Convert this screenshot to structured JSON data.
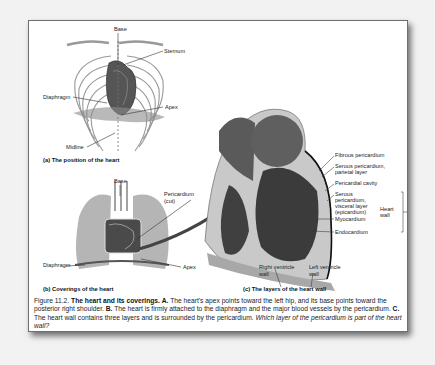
{
  "panel_a": {
    "caption": "(a) The position of the heart",
    "labels": {
      "base": "Base",
      "sternum": "Sternum",
      "diaphragm": "Diaphragm",
      "apex": "Apex",
      "midline": "Midline"
    }
  },
  "panel_b": {
    "caption": "(b) Coverings of the heart",
    "labels": {
      "base": "Base",
      "pericardium_line1": "Pericardium",
      "pericardium_line2": "(cut)",
      "diaphragm": "Diaphragm",
      "apex": "Apex"
    }
  },
  "panel_c": {
    "caption": "(c) The layers of the heart wall",
    "labels": {
      "fibrous": "Fibrous pericardium",
      "serous_parietal_1": "Serous pericardium,",
      "serous_parietal_2": "parietal layer",
      "pericardial_cavity": "Pericardial cavity",
      "serous_visceral_1": "Serous",
      "serous_visceral_2": "pericardium,",
      "serous_visceral_3": "visceral layer",
      "serous_visceral_4": "(epicardium)",
      "myocardium": "Myocardium",
      "endocardium": "Endocardium",
      "heart_wall_1": "Heart",
      "heart_wall_2": "wall",
      "right_ventricle_1": "Right ventricle",
      "right_ventricle_2": "wall",
      "left_ventricle_1": "Left ventricle",
      "left_ventricle_2": "wall"
    }
  },
  "figure_caption": {
    "number": "Figure 11.2.",
    "title": "The heart and its coverings.",
    "a_label": "A.",
    "a_text": "The heart's apex points toward the left hip, and its base points toward the posterior right shoulder.",
    "b_label": "B.",
    "b_text": "The heart is firmly attached to the diaphragm and the major blood vessels by the pericardium.",
    "c_label": "C.",
    "c_text": "The heart wall contains three layers and is surrounded by the pericardium.",
    "question": "Which layer of the pericardium is part of the heart wall?"
  }
}
